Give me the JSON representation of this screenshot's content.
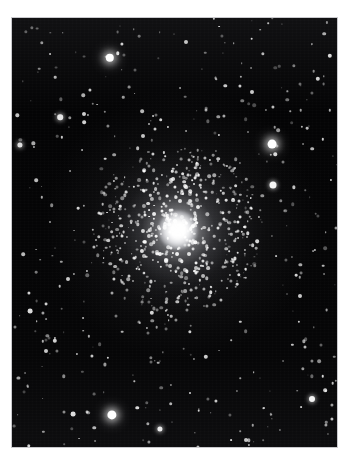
{
  "page": {
    "background_color": "#ffffff",
    "header_remnant_text": "· ·   ·   ·  · ·     ·   ·  ·"
  },
  "figure": {
    "name": "globular-cluster-photograph",
    "plate": {
      "x": 12,
      "y": 18,
      "width": 325,
      "height": 429,
      "sky_color": "#050505",
      "border_color": "#c9c9cd"
    },
    "cluster": {
      "center_x": 178,
      "center_y": 230,
      "core_radius_px": 20,
      "halo_radius_px": 86,
      "core_color": "#ffffff",
      "halo_color": "#e1e2e8"
    },
    "bright_field_stars": [
      {
        "x": 110,
        "y": 58,
        "r": 4.2,
        "b": 1.0
      },
      {
        "x": 272,
        "y": 144,
        "r": 4.4,
        "b": 1.0
      },
      {
        "x": 273,
        "y": 185,
        "r": 3.5,
        "b": 0.96
      },
      {
        "x": 112,
        "y": 415,
        "r": 4.6,
        "b": 1.0
      },
      {
        "x": 160,
        "y": 429,
        "r": 2.6,
        "b": 0.92
      },
      {
        "x": 60,
        "y": 117,
        "r": 2.8,
        "b": 0.9
      },
      {
        "x": 84,
        "y": 114,
        "r": 2.0,
        "b": 0.8
      },
      {
        "x": 30,
        "y": 311,
        "r": 2.4,
        "b": 0.85
      },
      {
        "x": 55,
        "y": 341,
        "r": 2.2,
        "b": 0.82
      },
      {
        "x": 73,
        "y": 414,
        "r": 2.4,
        "b": 0.86
      },
      {
        "x": 312,
        "y": 399,
        "r": 3.0,
        "b": 0.95
      },
      {
        "x": 46,
        "y": 351,
        "r": 2.0,
        "b": 0.78
      },
      {
        "x": 252,
        "y": 92,
        "r": 2.0,
        "b": 0.78
      },
      {
        "x": 318,
        "y": 79,
        "r": 2.2,
        "b": 0.82
      },
      {
        "x": 330,
        "y": 56,
        "r": 2.2,
        "b": 0.84
      },
      {
        "x": 186,
        "y": 42,
        "r": 2.0,
        "b": 0.76
      },
      {
        "x": 36,
        "y": 180,
        "r": 1.8,
        "b": 0.72
      },
      {
        "x": 23,
        "y": 254,
        "r": 1.8,
        "b": 0.72
      },
      {
        "x": 68,
        "y": 279,
        "r": 2.0,
        "b": 0.78
      },
      {
        "x": 152,
        "y": 313,
        "r": 2.2,
        "b": 0.82
      },
      {
        "x": 206,
        "y": 357,
        "r": 2.2,
        "b": 0.8
      },
      {
        "x": 300,
        "y": 296,
        "r": 2.0,
        "b": 0.78
      },
      {
        "x": 246,
        "y": 440,
        "r": 2.0,
        "b": 0.76
      },
      {
        "x": 20,
        "y": 145,
        "r": 2.6,
        "b": 0.88
      },
      {
        "x": 143,
        "y": 136,
        "r": 2.0,
        "b": 0.76
      }
    ],
    "faint_star_count": 420
  }
}
